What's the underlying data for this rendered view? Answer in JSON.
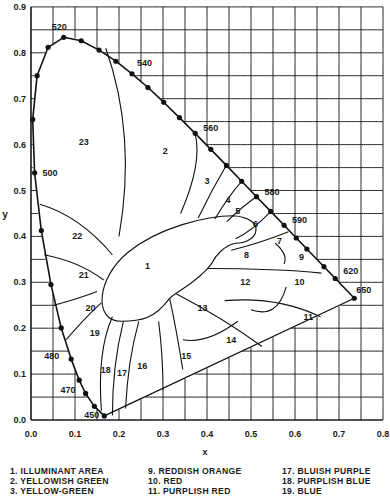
{
  "chart_data": {
    "type": "diagram",
    "xlabel": "x",
    "ylabel": "y",
    "xlim": [
      0.0,
      0.8
    ],
    "ylim": [
      0.0,
      0.9
    ],
    "grid": true,
    "grid_step": 0.05,
    "xticks": [
      "0.0",
      "0.1",
      "0.2",
      "0.3",
      "0.4",
      "0.5",
      "0.6",
      "0.7",
      "0.8"
    ],
    "yticks": [
      "0.0",
      "0.1",
      "0.2",
      "0.3",
      "0.4",
      "0.5",
      "0.6",
      "0.7",
      "0.8",
      "0.9"
    ],
    "spectral_locus": [
      [
        0.1666,
        0.0089
      ],
      [
        0.144,
        0.0297
      ],
      [
        0.1241,
        0.0578
      ],
      [
        0.1096,
        0.0868
      ],
      [
        0.0913,
        0.1327
      ],
      [
        0.0687,
        0.2007
      ],
      [
        0.0454,
        0.295
      ],
      [
        0.0235,
        0.4127
      ],
      [
        0.0082,
        0.5384
      ],
      [
        0.0039,
        0.6548
      ],
      [
        0.0139,
        0.7502
      ],
      [
        0.0389,
        0.812
      ],
      [
        0.0743,
        0.8338
      ],
      [
        0.1142,
        0.8262
      ],
      [
        0.1547,
        0.8059
      ],
      [
        0.1929,
        0.7816
      ],
      [
        0.2296,
        0.7543
      ],
      [
        0.2658,
        0.7243
      ],
      [
        0.3016,
        0.6923
      ],
      [
        0.3373,
        0.6589
      ],
      [
        0.3731,
        0.6245
      ],
      [
        0.4087,
        0.5896
      ],
      [
        0.4441,
        0.5547
      ],
      [
        0.4788,
        0.5202
      ],
      [
        0.5125,
        0.4866
      ],
      [
        0.5448,
        0.4544
      ],
      [
        0.5752,
        0.4242
      ],
      [
        0.6029,
        0.3965
      ],
      [
        0.627,
        0.3725
      ],
      [
        0.6658,
        0.334
      ],
      [
        0.6915,
        0.3083
      ],
      [
        0.7347,
        0.2653
      ]
    ],
    "wavelength_labels": [
      {
        "nm": "450",
        "x": 0.1666,
        "y": 0.0089
      },
      {
        "nm": "470",
        "x": 0.1241,
        "y": 0.0578
      },
      {
        "nm": "480",
        "x": 0.0913,
        "y": 0.1327
      },
      {
        "nm": "500",
        "x": 0.0082,
        "y": 0.5384
      },
      {
        "nm": "520",
        "x": 0.0743,
        "y": 0.8338
      },
      {
        "nm": "540",
        "x": 0.2296,
        "y": 0.7543
      },
      {
        "nm": "560",
        "x": 0.3731,
        "y": 0.6245
      },
      {
        "nm": "580",
        "x": 0.5125,
        "y": 0.4866
      },
      {
        "nm": "590",
        "x": 0.5752,
        "y": 0.4242
      },
      {
        "nm": "620",
        "x": 0.6915,
        "y": 0.3083
      },
      {
        "nm": "650",
        "x": 0.7347,
        "y": 0.2653
      }
    ],
    "region_labels": [
      {
        "id": "1",
        "x": 0.265,
        "y": 0.335
      },
      {
        "id": "2",
        "x": 0.305,
        "y": 0.585
      },
      {
        "id": "3",
        "x": 0.4,
        "y": 0.52
      },
      {
        "id": "4",
        "x": 0.448,
        "y": 0.48
      },
      {
        "id": "5",
        "x": 0.47,
        "y": 0.455
      },
      {
        "id": "6",
        "x": 0.51,
        "y": 0.428
      },
      {
        "id": "7",
        "x": 0.565,
        "y": 0.39
      },
      {
        "id": "8",
        "x": 0.49,
        "y": 0.36
      },
      {
        "id": "9",
        "x": 0.615,
        "y": 0.355
      },
      {
        "id": "10",
        "x": 0.61,
        "y": 0.3
      },
      {
        "id": "11",
        "x": 0.63,
        "y": 0.225
      },
      {
        "id": "12",
        "x": 0.487,
        "y": 0.3
      },
      {
        "id": "13",
        "x": 0.39,
        "y": 0.245
      },
      {
        "id": "14",
        "x": 0.455,
        "y": 0.175
      },
      {
        "id": "15",
        "x": 0.353,
        "y": 0.14
      },
      {
        "id": "16",
        "x": 0.253,
        "y": 0.117
      },
      {
        "id": "17",
        "x": 0.207,
        "y": 0.103
      },
      {
        "id": "18",
        "x": 0.17,
        "y": 0.11
      },
      {
        "id": "19",
        "x": 0.145,
        "y": 0.19
      },
      {
        "id": "20",
        "x": 0.135,
        "y": 0.245
      },
      {
        "id": "21",
        "x": 0.12,
        "y": 0.315
      },
      {
        "id": "22",
        "x": 0.105,
        "y": 0.4
      },
      {
        "id": "23",
        "x": 0.12,
        "y": 0.605
      }
    ]
  },
  "legend": {
    "col1": [
      "1. ILLUMINANT AREA",
      "2. YELLOWISH GREEN",
      "3. YELLOW-GREEN"
    ],
    "col2": [
      "9. REDDISH ORANGE",
      "10. RED",
      "11. PURPLISH RED"
    ],
    "col3": [
      "17. BLUISH PURPLE",
      "18. PURPLISH BLUE",
      "19. BLUE"
    ]
  }
}
